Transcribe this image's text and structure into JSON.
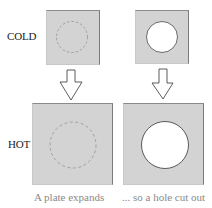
{
  "diagram": {
    "rows": [
      {
        "label": "COLD"
      },
      {
        "label": "HOT"
      }
    ],
    "columns": [
      {
        "caption": "A plate expands",
        "hole_style": "dashed-outline"
      },
      {
        "caption": "... so a hole cut out",
        "hole_style": "cut-out"
      }
    ],
    "colors": {
      "plate": "#d3d3d3",
      "plate_edge": "#7a7a7a",
      "hole": "#ffffff",
      "dashed_circle": "#9a9a9a",
      "arrow_stroke": "#333333",
      "caption": "#8a8a8a"
    }
  }
}
